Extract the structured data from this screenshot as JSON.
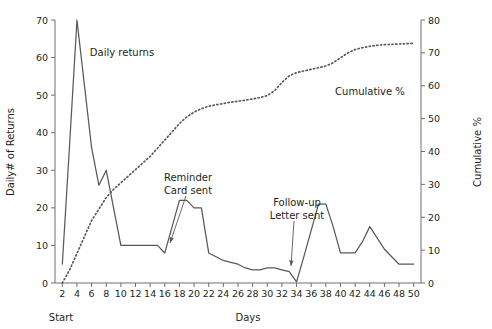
{
  "chart_data": {
    "type": "line",
    "title": "",
    "xlabel": "Days",
    "ylabel": "Daily# of Returns",
    "y2label": "Cumulative %",
    "grid": false,
    "legend": "inline-annotations",
    "xlim": [
      1,
      51
    ],
    "ylim": [
      0,
      70
    ],
    "y2lim": [
      0,
      80
    ],
    "xticks": [
      2,
      4,
      6,
      8,
      10,
      12,
      14,
      16,
      18,
      20,
      22,
      24,
      26,
      28,
      30,
      32,
      34,
      36,
      38,
      40,
      42,
      44,
      46,
      48,
      50
    ],
    "yticks": [
      0,
      10,
      20,
      30,
      40,
      50,
      60,
      70
    ],
    "y2ticks": [
      0,
      10,
      20,
      30,
      40,
      50,
      60,
      70,
      80
    ],
    "x_origin_note": "Start",
    "series": [
      {
        "name": "Daily returns",
        "style": "solid",
        "axis": "left",
        "x": [
          2,
          3,
          4,
          5,
          6,
          7,
          8,
          9,
          10,
          11,
          12,
          13,
          14,
          15,
          16,
          17,
          18,
          19,
          20,
          21,
          22,
          23,
          24,
          25,
          26,
          27,
          28,
          29,
          30,
          31,
          32,
          33,
          34,
          35,
          36,
          37,
          38,
          39,
          40,
          41,
          42,
          43,
          44,
          45,
          46,
          47,
          48,
          49,
          50
        ],
        "values": [
          5,
          37,
          70,
          53,
          36,
          26,
          30,
          20,
          10,
          10,
          10,
          10,
          10,
          10,
          8,
          15,
          22,
          22,
          20,
          20,
          8,
          7,
          6,
          5.5,
          5,
          4,
          3.5,
          3.5,
          4,
          4,
          3.5,
          3,
          0.3,
          7,
          14,
          21,
          21,
          15,
          8,
          8,
          8,
          11,
          15,
          12,
          9,
          7,
          5,
          5,
          5
        ]
      },
      {
        "name": "Cumulative %",
        "style": "dotted",
        "axis": "right",
        "x": [
          2,
          3,
          4,
          5,
          6,
          7,
          8,
          9,
          10,
          11,
          12,
          13,
          14,
          15,
          16,
          17,
          18,
          19,
          20,
          21,
          22,
          23,
          24,
          25,
          26,
          27,
          28,
          29,
          30,
          31,
          32,
          33,
          34,
          35,
          36,
          37,
          38,
          39,
          40,
          41,
          42,
          43,
          44,
          45,
          46,
          47,
          48,
          49,
          50
        ],
        "values": [
          0,
          4,
          9,
          14,
          19,
          22.5,
          26,
          28.5,
          30.5,
          32.5,
          34.5,
          36.5,
          38.5,
          41,
          43.5,
          46,
          48.5,
          50.5,
          52,
          53,
          53.8,
          54.2,
          54.6,
          55,
          55.3,
          55.6,
          56,
          56.4,
          57,
          58.5,
          61,
          63,
          64,
          64.5,
          65,
          65.5,
          66,
          67,
          68.5,
          70,
          71,
          71.6,
          72,
          72.3,
          72.5,
          72.6,
          72.7,
          72.8,
          72.9
        ]
      }
    ],
    "annotations": [
      {
        "id": "daily-returns-label",
        "text": "Daily returns",
        "text_x": 122,
        "text_y": 56,
        "has_arrow": false
      },
      {
        "id": "cumulative-label",
        "text": "Cumulative %",
        "text_x": 370,
        "text_y": 95,
        "has_arrow": false
      },
      {
        "id": "reminder-card-annotation",
        "line1": "Reminder",
        "line2": "Card sent",
        "text_x": 188,
        "text_y": 181,
        "has_arrow": true,
        "arrow_x1": 186,
        "arrow_y1": 196,
        "arrow_x2": 170,
        "arrow_y2": 243
      },
      {
        "id": "followup-letter-annotation",
        "line1": "Follow-up",
        "line2": "Letter sent",
        "text_x": 297,
        "text_y": 206,
        "has_arrow": true,
        "arrow_x1": 294,
        "arrow_y1": 221,
        "arrow_x2": 291,
        "arrow_y2": 266
      }
    ]
  },
  "geometry": {
    "plot_left": 55,
    "plot_right": 421,
    "plot_top": 20,
    "plot_bottom": 283
  }
}
